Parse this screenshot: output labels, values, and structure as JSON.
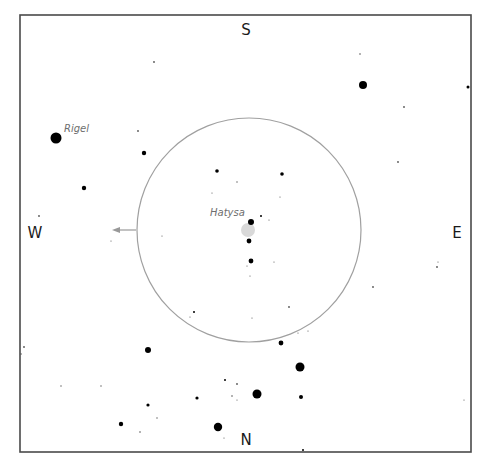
{
  "chart_data": {
    "type": "scatter",
    "title": "",
    "frame": {
      "x": 20,
      "y": 15,
      "width": 451,
      "height": 437,
      "stroke": "#4a4a4a"
    },
    "compass": {
      "top": "S",
      "bottom": "N",
      "left": "W",
      "right": "E"
    },
    "field_of_view": {
      "cx": 249,
      "cy": 230,
      "r": 112,
      "stroke": "#a0a0a0"
    },
    "direction_arrow": {
      "x1": 136,
      "y1": 230,
      "x2": 114,
      "y2": 230,
      "color": "#999999"
    },
    "labels": [
      {
        "text": "Rigel",
        "x": 64,
        "y": 131
      },
      {
        "text": "Hatysa",
        "x": 211,
        "y": 216
      }
    ],
    "highlight": {
      "name": "Hatysa-nebula",
      "cx": 248,
      "cy": 230,
      "r": 7,
      "color": "#d9d9d9"
    },
    "stars": [
      {
        "x": 56,
        "y": 138,
        "r": 5.5
      },
      {
        "x": 363,
        "y": 85,
        "r": 4
      },
      {
        "x": 468,
        "y": 87,
        "r": 1.5
      },
      {
        "x": 144,
        "y": 153,
        "r": 2.2
      },
      {
        "x": 84,
        "y": 188,
        "r": 2.2
      },
      {
        "x": 217,
        "y": 171,
        "r": 1.8
      },
      {
        "x": 282,
        "y": 174,
        "r": 1.8
      },
      {
        "x": 251,
        "y": 222,
        "r": 3
      },
      {
        "x": 249,
        "y": 241,
        "r": 2.4
      },
      {
        "x": 251,
        "y": 261,
        "r": 2.4
      },
      {
        "x": 148,
        "y": 350,
        "r": 3
      },
      {
        "x": 281,
        "y": 343,
        "r": 2.4
      },
      {
        "x": 300,
        "y": 367,
        "r": 4.5
      },
      {
        "x": 257,
        "y": 394,
        "r": 4.5
      },
      {
        "x": 301,
        "y": 397,
        "r": 2
      },
      {
        "x": 197,
        "y": 398,
        "r": 1.6
      },
      {
        "x": 148,
        "y": 405,
        "r": 1.6
      },
      {
        "x": 121,
        "y": 424,
        "r": 2.2
      },
      {
        "x": 218,
        "y": 427,
        "r": 4.2
      },
      {
        "x": 154,
        "y": 62,
        "r": 0.9
      },
      {
        "x": 360,
        "y": 54,
        "r": 0.8
      },
      {
        "x": 404,
        "y": 107,
        "r": 0.9
      },
      {
        "x": 138,
        "y": 131,
        "r": 0.9
      },
      {
        "x": 398,
        "y": 162,
        "r": 0.9
      },
      {
        "x": 39,
        "y": 216,
        "r": 0.9
      },
      {
        "x": 437,
        "y": 267,
        "r": 0.9
      },
      {
        "x": 438,
        "y": 262,
        "r": 0.6
      },
      {
        "x": 373,
        "y": 287,
        "r": 0.9
      },
      {
        "x": 237,
        "y": 182,
        "r": 0.7
      },
      {
        "x": 212,
        "y": 193,
        "r": 0.6
      },
      {
        "x": 280,
        "y": 197,
        "r": 0.6
      },
      {
        "x": 261,
        "y": 216,
        "r": 1
      },
      {
        "x": 269,
        "y": 220,
        "r": 0.6
      },
      {
        "x": 162,
        "y": 236,
        "r": 0.6
      },
      {
        "x": 111,
        "y": 241,
        "r": 0.6
      },
      {
        "x": 274,
        "y": 262,
        "r": 0.6
      },
      {
        "x": 247,
        "y": 266,
        "r": 0.6
      },
      {
        "x": 250,
        "y": 276,
        "r": 0.6
      },
      {
        "x": 289,
        "y": 307,
        "r": 0.9
      },
      {
        "x": 194,
        "y": 312,
        "r": 1
      },
      {
        "x": 190,
        "y": 317,
        "r": 0.6
      },
      {
        "x": 252,
        "y": 318,
        "r": 0.6
      },
      {
        "x": 298,
        "y": 333,
        "r": 0.6
      },
      {
        "x": 308,
        "y": 331,
        "r": 0.6
      },
      {
        "x": 24,
        "y": 347,
        "r": 0.9
      },
      {
        "x": 21,
        "y": 354,
        "r": 0.8
      },
      {
        "x": 61,
        "y": 386,
        "r": 0.7
      },
      {
        "x": 101,
        "y": 386,
        "r": 0.7
      },
      {
        "x": 225,
        "y": 380,
        "r": 1
      },
      {
        "x": 237,
        "y": 384,
        "r": 0.9
      },
      {
        "x": 232,
        "y": 396,
        "r": 0.8
      },
      {
        "x": 237,
        "y": 400,
        "r": 0.6
      },
      {
        "x": 464,
        "y": 400,
        "r": 0.6
      },
      {
        "x": 157,
        "y": 418,
        "r": 0.7
      },
      {
        "x": 140,
        "y": 432,
        "r": 0.8
      },
      {
        "x": 224,
        "y": 438,
        "r": 0.6
      },
      {
        "x": 303,
        "y": 450,
        "r": 1
      }
    ]
  }
}
